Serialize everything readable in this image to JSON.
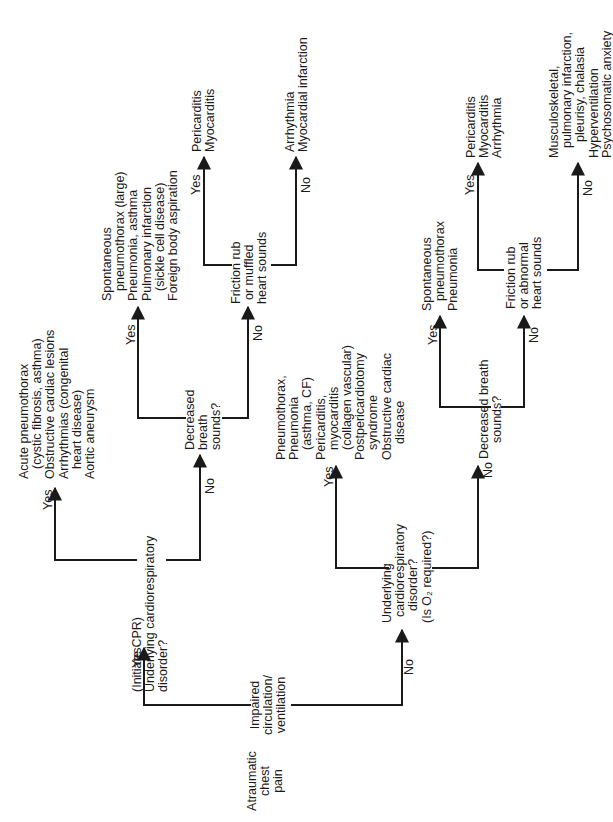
{
  "diagram": {
    "title_node": "Atraumatic chest pain",
    "nodes": {
      "impaired": [
        "Impaired",
        "circulation/",
        "ventilation"
      ],
      "cpr_disorder": [
        "(Initiate CPR)",
        "Underlying cardiorespiratory",
        "disorder?"
      ],
      "cpr_yes_outcomes": [
        "Acute pneumothorax",
        "(cystic fibrosis, asthma)",
        "Obstructive cardiac lesions",
        "Arrhythmias (congenital",
        "heart disease)",
        "Aortic aneurysm"
      ],
      "dbs_1": [
        "Decreased",
        "breath",
        "sounds?"
      ],
      "dbs_1_yes_outcomes": [
        "Spontaneous",
        "pneumothorax (large)",
        "Pneumonia, asthma",
        "Pulmonary infarction",
        "(sickle cell disease)",
        "Foreign body aspiration"
      ],
      "friction_1": [
        "Friction rub",
        "or muffled",
        "heart sounds"
      ],
      "friction_1_yes_outcomes": [
        "Pericarditis",
        "Myocarditis"
      ],
      "friction_1_no_outcomes": [
        "Arrhythmia",
        "Myocardial infarction"
      ],
      "o2_disorder": [
        "Underlying",
        "cardiorespiratory",
        "disorder?",
        "(Is O₂ required?)"
      ],
      "o2_yes_outcomes": [
        "Pneumothorax,",
        "Pneumonia",
        "(asthma, CF)",
        "Pericarditis,",
        "myocarditis",
        "(collagen vascular)",
        "Postpericardiotomy",
        "syndrome",
        "Obstructive cardiac",
        "disease"
      ],
      "dbs_2": [
        "Decreased breath",
        "sounds?"
      ],
      "dbs_2_yes_outcomes": [
        "Spontaneous",
        "pneumothorax",
        "Pneumonia"
      ],
      "friction_2": [
        "Friction rub",
        "or abnormal",
        "heart sounds"
      ],
      "friction_2_yes_outcomes": [
        "Pericarditis",
        "Myocarditis",
        "Arrhythmia"
      ],
      "friction_2_no_outcomes": [
        "Musculoskeletal,",
        "pulmonary infarction,",
        "pleurisy, chalasia",
        "Hyperventilation",
        "Psychosomatic anxiety"
      ]
    },
    "edge_labels": {
      "yes": "Yes",
      "no": "No"
    }
  }
}
